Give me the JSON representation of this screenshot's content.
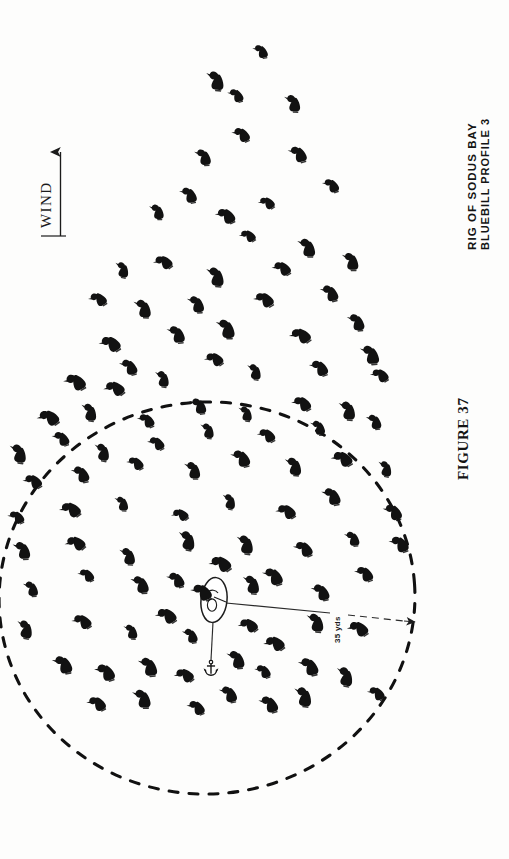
{
  "figure": {
    "caption_label": "FIGURE 37",
    "title_line1": "RIG OF SODUS BAY",
    "title_line2": "BLUEBILL PROFILE 3",
    "wind_label": "WIND",
    "scale_label": "35 yds",
    "ink_color": "#111111",
    "paper_color": "#fdfdfc"
  },
  "chart_data": {
    "type": "scatter",
    "xlabel": "",
    "ylabel": "",
    "grid": false,
    "legend": false,
    "xlim": [
      0,
      509
    ],
    "ylim": [
      0,
      859
    ],
    "annotations": [
      {
        "name": "wind-arrow",
        "text": "WIND",
        "from": [
          60,
          232
        ],
        "to": [
          60,
          148
        ]
      },
      {
        "name": "scale-bar",
        "text": "35 yds",
        "from": [
          222,
          604
        ],
        "to": [
          412,
          622
        ]
      },
      {
        "name": "figure-number",
        "text": "FIGURE 37"
      }
    ],
    "shapes": [
      {
        "name": "hunting-radius-circle",
        "type": "ellipse",
        "cx": 207,
        "cy": 598,
        "rx": 208,
        "ry": 196,
        "style": "dashed"
      },
      {
        "name": "boat-blind",
        "type": "ellipse",
        "cx": 214,
        "cy": 600,
        "rx": 13,
        "ry": 22
      },
      {
        "name": "anchor-rode",
        "type": "line",
        "from": [
          214,
          622
        ],
        "to": [
          211,
          664
        ]
      },
      {
        "name": "anchor",
        "type": "marker",
        "cx": 211,
        "cy": 668
      }
    ],
    "series": [
      {
        "name": "decoys",
        "marker": "duck-decoy-silhouette",
        "count": 103,
        "points": [
          [
            260,
            48
          ],
          [
            216,
            76
          ],
          [
            235,
            92
          ],
          [
            293,
            99
          ],
          [
            240,
            131
          ],
          [
            203,
            153
          ],
          [
            297,
            150
          ],
          [
            157,
            208
          ],
          [
            224,
            212
          ],
          [
            188,
            191
          ],
          [
            265,
            200
          ],
          [
            330,
            182
          ],
          [
            307,
            243
          ],
          [
            246,
            233
          ],
          [
            123,
            266
          ],
          [
            161,
            259
          ],
          [
            216,
            272
          ],
          [
            280,
            265
          ],
          [
            351,
            257
          ],
          [
            96,
            296
          ],
          [
            143,
            304
          ],
          [
            196,
            300
          ],
          [
            262,
            296
          ],
          [
            329,
            289
          ],
          [
            108,
            340
          ],
          [
            176,
            330
          ],
          [
            128,
            363
          ],
          [
            226,
            324
          ],
          [
            298,
            332
          ],
          [
            356,
            318
          ],
          [
            73,
            378
          ],
          [
            112,
            385
          ],
          [
            163,
            375
          ],
          [
            212,
            356
          ],
          [
            255,
            368
          ],
          [
            318,
            364
          ],
          [
            370,
            350
          ],
          [
            46,
            414
          ],
          [
            90,
            408
          ],
          [
            145,
            417
          ],
          [
            198,
            402
          ],
          [
            246,
            410
          ],
          [
            300,
            400
          ],
          [
            348,
            406
          ],
          [
            378,
            372
          ],
          [
            19,
            449
          ],
          [
            60,
            435
          ],
          [
            103,
            448
          ],
          [
            155,
            440
          ],
          [
            208,
            427
          ],
          [
            265,
            432
          ],
          [
            318,
            424
          ],
          [
            374,
            418
          ],
          [
            31,
            478
          ],
          [
            80,
            470
          ],
          [
            134,
            460
          ],
          [
            193,
            466
          ],
          [
            240,
            454
          ],
          [
            294,
            462
          ],
          [
            340,
            455
          ],
          [
            386,
            465
          ],
          [
            15,
            514
          ],
          [
            68,
            506
          ],
          [
            122,
            500
          ],
          [
            178,
            512
          ],
          [
            230,
            498
          ],
          [
            284,
            508
          ],
          [
            331,
            492
          ],
          [
            392,
            508
          ],
          [
            22,
            546
          ],
          [
            73,
            540
          ],
          [
            128,
            552
          ],
          [
            188,
            536
          ],
          [
            218,
            560
          ],
          [
            246,
            540
          ],
          [
            302,
            545
          ],
          [
            352,
            535
          ],
          [
            398,
            540
          ],
          [
            31,
            585
          ],
          [
            85,
            572
          ],
          [
            140,
            580
          ],
          [
            175,
            576
          ],
          [
            200,
            588
          ],
          [
            252,
            580
          ],
          [
            272,
            572
          ],
          [
            320,
            588
          ],
          [
            363,
            570
          ],
          [
            26,
            625
          ],
          [
            80,
            618
          ],
          [
            131,
            628
          ],
          [
            164,
            612
          ],
          [
            190,
            632
          ],
          [
            246,
            622
          ],
          [
            272,
            640
          ],
          [
            316,
            618
          ],
          [
            356,
            625
          ],
          [
            62,
            660
          ],
          [
            104,
            668
          ],
          [
            148,
            662
          ],
          [
            182,
            672
          ],
          [
            236,
            655
          ],
          [
            262,
            668
          ],
          [
            308,
            662
          ],
          [
            346,
            672
          ],
          [
            95,
            700
          ],
          [
            142,
            694
          ],
          [
            195,
            704
          ],
          [
            228,
            690
          ],
          [
            268,
            700
          ],
          [
            304,
            692
          ],
          [
            375,
            690
          ]
        ]
      }
    ]
  }
}
